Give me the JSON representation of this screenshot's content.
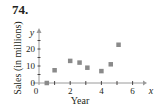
{
  "problem_number": "74.",
  "chart_data": {
    "type": "scatter",
    "title": "",
    "xlabel": "Year",
    "ylabel": "Sales (in millions)",
    "x_axis_var": "x",
    "y_axis_var": "y",
    "x_ticks": [
      0,
      2,
      4,
      6
    ],
    "y_ticks": [
      0,
      10,
      20
    ],
    "xlim": [
      0,
      7
    ],
    "ylim": [
      0,
      28
    ],
    "grid": false,
    "legend": null,
    "marker": "square",
    "marker_color": "#8a8a8a",
    "points": [
      {
        "x": 0.5,
        "y": 0
      },
      {
        "x": 1.0,
        "y": 7.5
      },
      {
        "x": 2.0,
        "y": 13
      },
      {
        "x": 2.6,
        "y": 12
      },
      {
        "x": 3.1,
        "y": 9
      },
      {
        "x": 4.0,
        "y": 7
      },
      {
        "x": 4.6,
        "y": 11
      },
      {
        "x": 5.1,
        "y": 22.5
      }
    ]
  }
}
